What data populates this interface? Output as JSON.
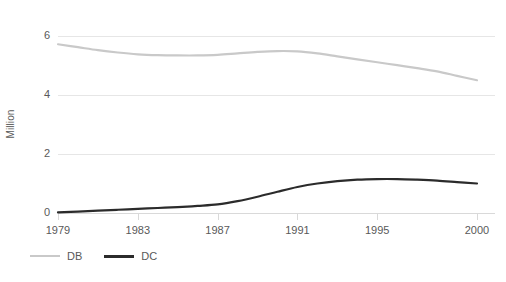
{
  "chart_data": {
    "type": "line",
    "title": "",
    "xlabel": "",
    "ylabel": "Million",
    "xlim": [
      1979,
      2000
    ],
    "ylim": [
      0,
      6
    ],
    "y_ticks": [
      0,
      2,
      4,
      6
    ],
    "y_tick_labels": [
      "0",
      "2",
      "4",
      "6"
    ],
    "x_ticks": [
      1979,
      1983,
      1987,
      1991,
      1995,
      2000
    ],
    "x_tick_labels": [
      "1979",
      "1983",
      "1987",
      "1991",
      "1995",
      "2000"
    ],
    "grid": "horizontal",
    "legend_position": "bottom-left",
    "x": [
      1979,
      1980,
      1981,
      1982,
      1983,
      1984,
      1985,
      1986,
      1987,
      1988,
      1989,
      1990,
      1991,
      1992,
      1993,
      1994,
      1995,
      1996,
      1997,
      1998,
      1999,
      2000
    ],
    "series": [
      {
        "name": "DB",
        "color": "#c9c9c9",
        "values": [
          5.72,
          5.62,
          5.52,
          5.44,
          5.38,
          5.35,
          5.34,
          5.34,
          5.36,
          5.41,
          5.46,
          5.49,
          5.48,
          5.41,
          5.31,
          5.21,
          5.11,
          5.01,
          4.91,
          4.8,
          4.65,
          4.5
        ]
      },
      {
        "name": "DC",
        "color": "#2b2b2b",
        "values": [
          0.02,
          0.05,
          0.08,
          0.11,
          0.14,
          0.17,
          0.2,
          0.24,
          0.29,
          0.4,
          0.55,
          0.72,
          0.88,
          1.0,
          1.08,
          1.13,
          1.15,
          1.15,
          1.13,
          1.1,
          1.05,
          1.0
        ]
      }
    ]
  },
  "legend": {
    "items": [
      {
        "label": "DB",
        "color": "#c9c9c9"
      },
      {
        "label": "DC",
        "color": "#2b2b2b"
      }
    ]
  },
  "axes": {
    "y_title": "Million"
  }
}
